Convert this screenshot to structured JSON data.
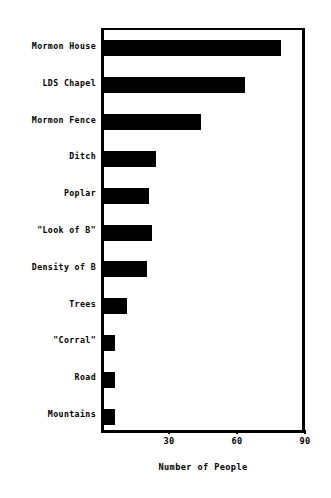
{
  "chart_data": {
    "type": "bar",
    "orientation": "horizontal",
    "title": "",
    "xlabel": "Number of People",
    "ylabel": "",
    "xlim": [
      0,
      90
    ],
    "xticks": [
      30,
      60,
      90
    ],
    "xtick_labels": [
      "30",
      "60",
      "90"
    ],
    "grid": false,
    "legend": null,
    "bar_color": "#000000",
    "background_color": "#ffffff",
    "categories": [
      "Mormon House",
      "LDS Chapel",
      "Mormon Fence",
      "Ditch",
      "Poplar",
      "\"Look of B\"",
      "Density of B",
      "Trees",
      "\"Corral\"",
      "Road",
      "Mountains"
    ],
    "values": [
      78,
      62,
      43,
      23,
      20,
      21,
      19,
      10,
      5,
      5,
      5
    ]
  }
}
